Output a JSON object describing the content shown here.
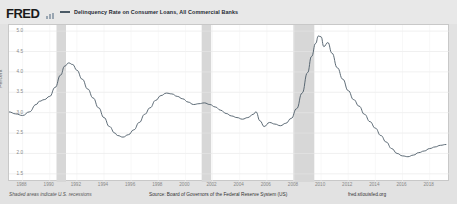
{
  "header": {
    "logo_text": "FRED",
    "logo_mark_icon": "bar-chart-icon",
    "legend_swatch_color": "#4b5a66",
    "legend_label": "Delinquency Rate on Consumer Loans, All Commercial Banks"
  },
  "footer": {
    "left_note": "Shaded areas indicate U.S. recessions",
    "source": "Source: Board of Governors of the Federal Reserve System (US)",
    "site": "fred.stlouisfed.org"
  },
  "chart_data": {
    "type": "line",
    "title": "Delinquency Rate on Consumer Loans, All Commercial Banks",
    "xlabel": "",
    "ylabel": "Percent",
    "ylim": [
      1.3,
      5.15
    ],
    "xlim": [
      1987.0,
      2019.5
    ],
    "grid": true,
    "legend_position": "top",
    "line_color": "#4b5a66",
    "recession_color": "#d7d7d7",
    "yticks": [
      1.5,
      2.0,
      2.5,
      3.0,
      3.5,
      4.0,
      4.5,
      5.0
    ],
    "ytick_labels": [
      "1.5",
      "2.0",
      "2.5",
      "3.0",
      "3.5",
      "4.0",
      "4.5",
      "5.0"
    ],
    "xticks": [
      1988,
      1990,
      1992,
      1994,
      1996,
      1998,
      2000,
      2002,
      2004,
      2006,
      2008,
      2010,
      2012,
      2014,
      2016,
      2018
    ],
    "xtick_labels": [
      "1988",
      "1990",
      "1992",
      "1994",
      "1996",
      "1998",
      "2000",
      "2002",
      "2004",
      "2006",
      "2008",
      "2010",
      "2012",
      "2014",
      "2016",
      "2018"
    ],
    "recessions": [
      {
        "start": 1990.5,
        "end": 1991.2
      },
      {
        "start": 2001.2,
        "end": 2001.9
      },
      {
        "start": 2007.95,
        "end": 2009.5
      }
    ],
    "series": [
      {
        "name": "Delinquency Rate on Consumer Loans, All Commercial Banks",
        "x": [
          1987.0,
          1987.5,
          1988.0,
          1988.5,
          1989.0,
          1989.25,
          1989.6,
          1990.0,
          1990.4,
          1990.8,
          1991.1,
          1991.4,
          1991.7,
          1992.0,
          1992.4,
          1992.8,
          1993.2,
          1993.6,
          1994.0,
          1994.4,
          1994.8,
          1995.0,
          1995.4,
          1995.8,
          1996.2,
          1996.6,
          1997.0,
          1997.4,
          1997.8,
          1998.2,
          1998.6,
          1999.0,
          1999.4,
          1999.8,
          2000.2,
          2000.6,
          2001.0,
          2001.4,
          2001.8,
          2002.2,
          2002.6,
          2003.0,
          2003.4,
          2003.8,
          2004.2,
          2004.6,
          2005.0,
          2005.2,
          2005.5,
          2005.8,
          2006.2,
          2006.6,
          2007.0,
          2007.4,
          2007.8,
          2008.2,
          2008.6,
          2009.0,
          2009.3,
          2009.6,
          2009.8,
          2010.0,
          2010.2,
          2010.5,
          2010.8,
          2011.2,
          2011.6,
          2012.0,
          2012.4,
          2012.8,
          2013.2,
          2013.6,
          2014.0,
          2014.4,
          2014.8,
          2015.2,
          2015.6,
          2016.0,
          2016.4,
          2016.8,
          2017.2,
          2017.6,
          2018.0,
          2018.4,
          2018.8,
          2019.2
        ],
        "y": [
          3.02,
          2.97,
          2.93,
          3.02,
          3.2,
          3.28,
          3.32,
          3.4,
          3.62,
          3.92,
          4.14,
          4.22,
          4.18,
          4.04,
          3.82,
          3.58,
          3.36,
          3.12,
          2.88,
          2.66,
          2.5,
          2.44,
          2.4,
          2.46,
          2.58,
          2.76,
          2.96,
          3.12,
          3.3,
          3.42,
          3.48,
          3.46,
          3.4,
          3.34,
          3.26,
          3.2,
          3.22,
          3.24,
          3.2,
          3.14,
          3.06,
          2.98,
          2.92,
          2.88,
          2.84,
          2.88,
          2.96,
          3.02,
          2.8,
          2.66,
          2.76,
          2.72,
          2.68,
          2.74,
          2.86,
          3.1,
          3.48,
          3.98,
          4.38,
          4.7,
          4.88,
          4.86,
          4.62,
          4.72,
          4.46,
          4.1,
          3.82,
          3.54,
          3.32,
          3.16,
          2.96,
          2.78,
          2.62,
          2.44,
          2.28,
          2.12,
          2.0,
          1.94,
          1.92,
          1.96,
          2.02,
          2.06,
          2.12,
          2.16,
          2.2,
          2.22
        ]
      }
    ]
  }
}
